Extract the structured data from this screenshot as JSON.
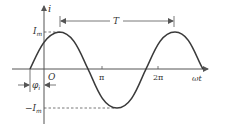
{
  "diagram": {
    "type": "sinusoidal current waveform",
    "colors": {
      "curve": "#3a3a3a",
      "axis": "#555555",
      "dashed": "#555555",
      "text": "#333333"
    },
    "y_axis": {
      "label": "i"
    },
    "x_axis": {
      "label": "ωt"
    },
    "origin_label": "O",
    "amplitude_label": {
      "main": "I",
      "sub": "m"
    },
    "neg_amplitude_label": {
      "prefix": "−",
      "main": "I",
      "sub": "m"
    },
    "period_label": "T",
    "phase_label": {
      "main": "φ",
      "sub": "i"
    },
    "ticks": [
      {
        "label": "π"
      },
      {
        "label": "2π"
      }
    ]
  }
}
